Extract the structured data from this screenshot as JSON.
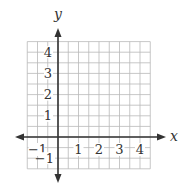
{
  "diagram": {
    "type": "coordinate-plane",
    "axes": {
      "x_label": "x",
      "y_label": "y",
      "x_range": [
        -1.5,
        4.5
      ],
      "y_range": [
        -1.5,
        4.5
      ]
    },
    "grid": {
      "minor_step": 0.5,
      "color": "#b9b9b9",
      "axis_color": "#333333"
    },
    "x_ticks": [
      {
        "value": -1,
        "label": "−1"
      },
      {
        "value": 1,
        "label": "1"
      },
      {
        "value": 2,
        "label": "2"
      },
      {
        "value": 3,
        "label": "3"
      },
      {
        "value": 4,
        "label": "4"
      }
    ],
    "y_ticks": [
      {
        "value": -1,
        "label": "−1"
      },
      {
        "value": 1,
        "label": "1"
      },
      {
        "value": 2,
        "label": "2"
      },
      {
        "value": 3,
        "label": "3"
      },
      {
        "value": 4,
        "label": "4"
      }
    ]
  }
}
